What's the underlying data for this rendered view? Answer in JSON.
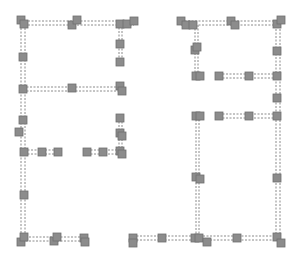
{
  "diagram": {
    "type": "floorplan-graph",
    "colors": {
      "node_fill": "#8c8c8c",
      "node_stroke": "#6f6f6f",
      "edge": "#8a8a8a",
      "background": "#ffffff"
    },
    "node_size": 8,
    "nodes": [
      {
        "x": 21,
        "y": 20
      },
      {
        "x": 24,
        "y": 24
      },
      {
        "x": 72,
        "y": 25
      },
      {
        "x": 77,
        "y": 20
      },
      {
        "x": 120,
        "y": 24
      },
      {
        "x": 127,
        "y": 24
      },
      {
        "x": 134,
        "y": 21
      },
      {
        "x": 120,
        "y": 44
      },
      {
        "x": 120,
        "y": 62
      },
      {
        "x": 23,
        "y": 57
      },
      {
        "x": 23,
        "y": 89
      },
      {
        "x": 72,
        "y": 88
      },
      {
        "x": 120,
        "y": 86
      },
      {
        "x": 122,
        "y": 91
      },
      {
        "x": 23,
        "y": 120
      },
      {
        "x": 19,
        "y": 132
      },
      {
        "x": 120,
        "y": 118
      },
      {
        "x": 120,
        "y": 133
      },
      {
        "x": 122,
        "y": 136
      },
      {
        "x": 24,
        "y": 152
      },
      {
        "x": 42,
        "y": 152
      },
      {
        "x": 58,
        "y": 152
      },
      {
        "x": 87,
        "y": 152
      },
      {
        "x": 103,
        "y": 152
      },
      {
        "x": 120,
        "y": 151
      },
      {
        "x": 122,
        "y": 154
      },
      {
        "x": 24,
        "y": 195
      },
      {
        "x": 21,
        "y": 242
      },
      {
        "x": 24,
        "y": 237
      },
      {
        "x": 54,
        "y": 241
      },
      {
        "x": 57,
        "y": 237
      },
      {
        "x": 84,
        "y": 238
      },
      {
        "x": 85,
        "y": 242
      },
      {
        "x": 181,
        "y": 21
      },
      {
        "x": 186,
        "y": 25
      },
      {
        "x": 193,
        "y": 25
      },
      {
        "x": 231,
        "y": 21
      },
      {
        "x": 235,
        "y": 25
      },
      {
        "x": 277,
        "y": 24
      },
      {
        "x": 281,
        "y": 20
      },
      {
        "x": 195,
        "y": 50
      },
      {
        "x": 197,
        "y": 47
      },
      {
        "x": 277,
        "y": 51
      },
      {
        "x": 196,
        "y": 76
      },
      {
        "x": 200,
        "y": 76
      },
      {
        "x": 219,
        "y": 76
      },
      {
        "x": 249,
        "y": 76
      },
      {
        "x": 277,
        "y": 76
      },
      {
        "x": 277,
        "y": 98
      },
      {
        "x": 196,
        "y": 116
      },
      {
        "x": 200,
        "y": 116
      },
      {
        "x": 219,
        "y": 116
      },
      {
        "x": 249,
        "y": 116
      },
      {
        "x": 277,
        "y": 116
      },
      {
        "x": 196,
        "y": 177
      },
      {
        "x": 200,
        "y": 179
      },
      {
        "x": 277,
        "y": 178
      },
      {
        "x": 133,
        "y": 238
      },
      {
        "x": 133,
        "y": 243
      },
      {
        "x": 162,
        "y": 238
      },
      {
        "x": 195,
        "y": 238
      },
      {
        "x": 199,
        "y": 238
      },
      {
        "x": 207,
        "y": 242
      },
      {
        "x": 237,
        "y": 238
      },
      {
        "x": 277,
        "y": 237
      },
      {
        "x": 281,
        "y": 243
      }
    ],
    "edges": [
      {
        "x1": 21,
        "y1": 21,
        "x2": 134,
        "y2": 21
      },
      {
        "x1": 21,
        "y1": 25,
        "x2": 134,
        "y2": 25
      },
      {
        "x1": 21,
        "y1": 21,
        "x2": 21,
        "y2": 241
      },
      {
        "x1": 25,
        "y1": 21,
        "x2": 25,
        "y2": 241
      },
      {
        "x1": 119,
        "y1": 24,
        "x2": 119,
        "y2": 64
      },
      {
        "x1": 122,
        "y1": 24,
        "x2": 122,
        "y2": 64
      },
      {
        "x1": 23,
        "y1": 87,
        "x2": 122,
        "y2": 87
      },
      {
        "x1": 23,
        "y1": 91,
        "x2": 122,
        "y2": 91
      },
      {
        "x1": 119,
        "y1": 118,
        "x2": 119,
        "y2": 152
      },
      {
        "x1": 122,
        "y1": 118,
        "x2": 122,
        "y2": 152
      },
      {
        "x1": 24,
        "y1": 150,
        "x2": 58,
        "y2": 150
      },
      {
        "x1": 24,
        "y1": 154,
        "x2": 58,
        "y2": 154
      },
      {
        "x1": 87,
        "y1": 150,
        "x2": 122,
        "y2": 150
      },
      {
        "x1": 87,
        "y1": 154,
        "x2": 122,
        "y2": 154
      },
      {
        "x1": 22,
        "y1": 237,
        "x2": 85,
        "y2": 237
      },
      {
        "x1": 22,
        "y1": 241,
        "x2": 85,
        "y2": 241
      },
      {
        "x1": 181,
        "y1": 21,
        "x2": 281,
        "y2": 21
      },
      {
        "x1": 181,
        "y1": 25,
        "x2": 281,
        "y2": 25
      },
      {
        "x1": 195,
        "y1": 25,
        "x2": 195,
        "y2": 78
      },
      {
        "x1": 198,
        "y1": 25,
        "x2": 198,
        "y2": 78
      },
      {
        "x1": 276,
        "y1": 22,
        "x2": 276,
        "y2": 240
      },
      {
        "x1": 280,
        "y1": 22,
        "x2": 280,
        "y2": 240
      },
      {
        "x1": 219,
        "y1": 74,
        "x2": 277,
        "y2": 74
      },
      {
        "x1": 219,
        "y1": 78,
        "x2": 277,
        "y2": 78
      },
      {
        "x1": 219,
        "y1": 114,
        "x2": 277,
        "y2": 114
      },
      {
        "x1": 219,
        "y1": 118,
        "x2": 277,
        "y2": 118
      },
      {
        "x1": 196,
        "y1": 116,
        "x2": 196,
        "y2": 238
      },
      {
        "x1": 199,
        "y1": 116,
        "x2": 199,
        "y2": 238
      },
      {
        "x1": 133,
        "y1": 236,
        "x2": 281,
        "y2": 236
      },
      {
        "x1": 133,
        "y1": 240,
        "x2": 281,
        "y2": 240
      }
    ]
  }
}
